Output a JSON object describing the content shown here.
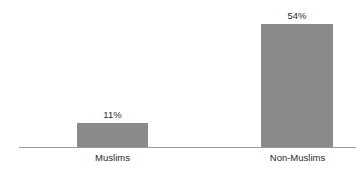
{
  "chart_data": {
    "type": "bar",
    "title": "",
    "subtitle": "",
    "xlabel": "",
    "ylabel": "",
    "categories": [
      "Muslims",
      "Non-Muslims"
    ],
    "values": [
      11,
      54
    ],
    "value_labels": [
      "11%",
      "54%"
    ],
    "unit": "%",
    "ylim": [
      0,
      64
    ],
    "grid": false,
    "legend": null,
    "axis": {
      "baseline_visible": true,
      "y_axis_visible": false,
      "ticks_visible": false
    },
    "style": {
      "bar_color": "#8a8a8a",
      "axis_color": "#9a9a9a",
      "text_color": "#2b2b2b",
      "background": "#ffffff"
    }
  }
}
